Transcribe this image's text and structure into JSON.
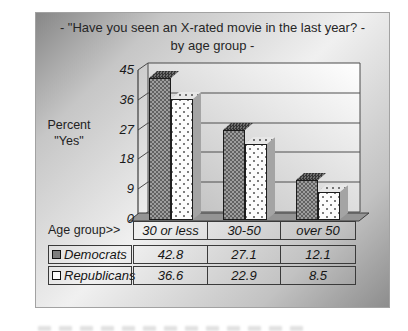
{
  "title": {
    "line1": "-  \"Have you seen an X-rated movie in the last year? -",
    "line2": "by age group  -"
  },
  "y_axis": {
    "title_line1": "Percent",
    "title_line2": "\"Yes\"",
    "ticks": [
      "45",
      "36",
      "27",
      "18",
      "9",
      "0"
    ]
  },
  "x_axis": {
    "label": "Age group>>"
  },
  "table": {
    "categories": [
      "30 or less",
      "30-50",
      "over 50"
    ],
    "rows": [
      {
        "label": "Democrats",
        "values": [
          "42.8",
          "27.1",
          "12.1"
        ]
      },
      {
        "label": "Republicans",
        "values": [
          "36.6",
          "22.9",
          "8.5"
        ]
      }
    ]
  },
  "colors": {
    "democrat_bar": "#848484",
    "republican_bar": "#fcfcfc",
    "floor": "#949494",
    "background_gradient": [
      "#878787",
      "#f0f0f0",
      "#8d8d8d"
    ]
  },
  "chart_data": {
    "type": "bar",
    "style": "3d-column",
    "title": "- \"Have you seen an X-rated movie in the last year? - by age group -",
    "categories": [
      "30 or less",
      "30-50",
      "over 50"
    ],
    "series": [
      {
        "name": "Democrats",
        "values": [
          42.8,
          27.1,
          12.1
        ]
      },
      {
        "name": "Republicans",
        "values": [
          36.6,
          22.9,
          8.5
        ]
      }
    ],
    "xlabel": "Age group>>",
    "ylabel": "Percent \"Yes\"",
    "ylim": [
      0,
      45
    ],
    "yticks": [
      0,
      9,
      18,
      27,
      36,
      45
    ],
    "grid": true,
    "legend_position": "bottom-left-table"
  }
}
